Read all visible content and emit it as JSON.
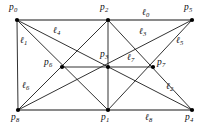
{
  "figure": {
    "kind": "pappus-configuration-diagram",
    "width": 208,
    "height": 130,
    "background_color": "#ffffff",
    "line_color": "#1b1b1b",
    "highlight_line_color": "#8a8a8a",
    "vertex_color": "#000000"
  },
  "points": [
    {
      "id": "p0",
      "label": "p",
      "sub": "0",
      "x": 17,
      "y": 20,
      "label_x": 9,
      "label_y": 3
    },
    {
      "id": "p2",
      "label": "p",
      "sub": "2",
      "x": 108,
      "y": 20,
      "label_x": 100,
      "label_y": 3
    },
    {
      "id": "p5",
      "label": "p",
      "sub": "5",
      "x": 192,
      "y": 20,
      "label_x": 184,
      "label_y": 3
    },
    {
      "id": "p6",
      "label": "p",
      "sub": "6",
      "x": 62,
      "y": 67,
      "label_x": 44,
      "label_y": 58
    },
    {
      "id": "p3",
      "label": "p",
      "sub": "3",
      "x": 108,
      "y": 67,
      "label_x": 100,
      "label_y": 50
    },
    {
      "id": "p7",
      "label": "p",
      "sub": "7",
      "x": 153,
      "y": 67,
      "label_x": 157,
      "label_y": 58
    },
    {
      "id": "p8",
      "label": "p",
      "sub": "8",
      "x": 18,
      "y": 110,
      "label_x": 11,
      "label_y": 113
    },
    {
      "id": "p1",
      "label": "p",
      "sub": "1",
      "x": 108,
      "y": 110,
      "label_x": 101,
      "label_y": 113
    },
    {
      "id": "p4",
      "label": "p",
      "sub": "4",
      "x": 192,
      "y": 110,
      "label_x": 185,
      "label_y": 113
    }
  ],
  "lines": [
    {
      "id": "l0",
      "label": "ℓ",
      "sub": "0",
      "through": [
        "p0",
        "p2",
        "p5"
      ],
      "style": "thick-gray",
      "label_x": 142,
      "label_y": 8
    },
    {
      "id": "l1",
      "label": "ℓ",
      "sub": "1",
      "through": [
        "p0",
        "p3",
        "p4"
      ],
      "style": "plain",
      "label_x": 20,
      "label_y": 36
    },
    {
      "id": "l2",
      "label": "ℓ",
      "sub": "2",
      "through": [
        "p2",
        "p7",
        "p4"
      ],
      "style": "plain",
      "label_x": 166,
      "label_y": 82
    },
    {
      "id": "l3",
      "label": "ℓ",
      "sub": "3",
      "through": [
        "p5",
        "p3",
        "p8"
      ],
      "style": "plain",
      "label_x": 139,
      "label_y": 27
    },
    {
      "id": "l4",
      "label": "ℓ",
      "sub": "4",
      "through": [
        "p0",
        "p7",
        "p1"
      ],
      "style": "plain",
      "label_x": 53,
      "label_y": 26
    },
    {
      "id": "l5",
      "label": "ℓ",
      "sub": "5",
      "through": [
        "p5",
        "p7",
        "p1"
      ],
      "style": "plain",
      "label_x": 176,
      "label_y": 36
    },
    {
      "id": "l6",
      "label": "ℓ",
      "sub": "6",
      "through": [
        "p8",
        "p6",
        "p2"
      ],
      "style": "plain",
      "label_x": 22,
      "label_y": 81
    },
    {
      "id": "l7",
      "label": "ℓ",
      "sub": "7",
      "through": [
        "p6",
        "p3",
        "p7"
      ],
      "style": "plain",
      "label_x": 127,
      "label_y": 53
    },
    {
      "id": "l8",
      "label": "ℓ",
      "sub": "8",
      "through": [
        "p8",
        "p1",
        "p4"
      ],
      "style": "thick-gray",
      "label_x": 145,
      "label_y": 113
    }
  ],
  "segments": [
    {
      "name": "segment-p0-p5-top",
      "from": "p0",
      "to": "p5",
      "style": "thick-gray"
    },
    {
      "name": "segment-p8-p4-bottom",
      "from": "p8",
      "to": "p4",
      "style": "thick-gray"
    },
    {
      "name": "segment-p6-p7-middle",
      "from": "p6",
      "to": "p7",
      "style": "plain"
    },
    {
      "name": "segment-p0-p1",
      "from": "p0",
      "to": "p1",
      "style": "plain"
    },
    {
      "name": "segment-p0-p4",
      "from": "p0",
      "to": "p4",
      "style": "plain"
    },
    {
      "name": "segment-p0-p8",
      "from": "p0",
      "to": "p8",
      "style": "plain"
    },
    {
      "name": "segment-p2-p8",
      "from": "p2",
      "to": "p8",
      "style": "plain"
    },
    {
      "name": "segment-p2-p4",
      "from": "p2",
      "to": "p4",
      "style": "plain"
    },
    {
      "name": "segment-p2-p1",
      "from": "p2",
      "to": "p1",
      "style": "plain"
    },
    {
      "name": "segment-p5-p8",
      "from": "p5",
      "to": "p8",
      "style": "plain"
    },
    {
      "name": "segment-p5-p1",
      "from": "p5",
      "to": "p1",
      "style": "plain"
    }
  ]
}
